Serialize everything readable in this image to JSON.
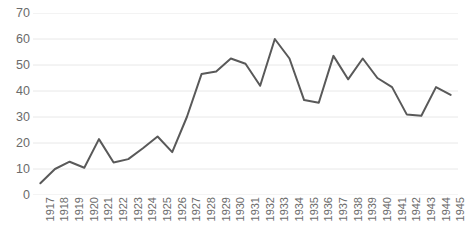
{
  "chart_data": {
    "type": "line",
    "title": "",
    "title_note": "title-clipped-above-top-edge",
    "subtitle": "",
    "xlabel": "",
    "ylabel": "",
    "x": [
      1917,
      1918,
      1919,
      1920,
      1921,
      1922,
      1923,
      1924,
      1925,
      1926,
      1927,
      1928,
      1929,
      1930,
      1931,
      1932,
      1933,
      1934,
      1935,
      1936,
      1937,
      1938,
      1939,
      1940,
      1941,
      1942,
      1943,
      1944,
      1945
    ],
    "categories": [
      "1917",
      "1918",
      "1919",
      "1920",
      "1921",
      "1922",
      "1923",
      "1924",
      "1925",
      "1926",
      "1927",
      "1928",
      "1929",
      "1930",
      "1931",
      "1932",
      "1933",
      "1934",
      "1935",
      "1936",
      "1937",
      "1938",
      "1939",
      "1940",
      "1941",
      "1942",
      "1943",
      "1944",
      "1945"
    ],
    "values": [
      4.5,
      10.0,
      12.8,
      10.5,
      21.5,
      12.5,
      13.8,
      18.0,
      22.5,
      16.5,
      30.0,
      46.5,
      47.5,
      52.5,
      50.5,
      42.0,
      60.0,
      52.5,
      36.5,
      35.5,
      53.5,
      44.5,
      52.5,
      45.0,
      41.5,
      31.0,
      30.5,
      41.5,
      38.5
    ],
    "series": [
      {
        "name": "series-1",
        "color": "#595959",
        "values": [
          4.5,
          10.0,
          12.8,
          10.5,
          21.5,
          12.5,
          13.8,
          18.0,
          22.5,
          16.5,
          30.0,
          46.5,
          47.5,
          52.5,
          50.5,
          42.0,
          60.0,
          52.5,
          36.5,
          35.5,
          53.5,
          44.5,
          52.5,
          45.0,
          41.5,
          31.0,
          30.5,
          41.5,
          38.5
        ]
      }
    ],
    "ylim": [
      0,
      70
    ],
    "yticks": [
      0,
      10,
      20,
      30,
      40,
      50,
      60,
      70
    ],
    "ytick_labels": [
      "0",
      "10",
      "20",
      "30",
      "40",
      "50",
      "60",
      "70"
    ],
    "grid": true,
    "grid_axis": "y",
    "grid_color": "#e8e8e8",
    "legend": false,
    "legend_position": "none",
    "line_color": "#595959",
    "line_width": 2,
    "markers": false,
    "axis_label_color": "#6b6b6b",
    "xtick_rotation": -90,
    "background": "#ffffff",
    "annotations": []
  }
}
